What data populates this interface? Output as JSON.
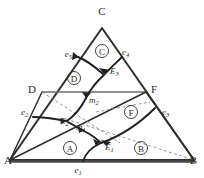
{
  "diagram": {
    "type": "ternary-phase-diagram",
    "background_color": "#ffffff",
    "line_color": "#2e2e2e",
    "dashed_color": "#8c8c8c",
    "curve_color": "#1f1f1f",
    "vertices": [
      {
        "id": "A",
        "label": "A",
        "x": 10,
        "y": 160,
        "label_x": 6,
        "label_y": 164
      },
      {
        "id": "B",
        "label": "B",
        "x": 194,
        "y": 160,
        "label_x": 192,
        "label_y": 164
      },
      {
        "id": "C",
        "label": "C",
        "x": 102,
        "y": 28,
        "label_x": 102,
        "label_y": 13
      },
      {
        "id": "D",
        "label": "D",
        "x": 42,
        "y": 92,
        "label_x": 34,
        "label_y": 91
      },
      {
        "id": "F",
        "label": "F",
        "x": 146,
        "y": 92,
        "label_x": 152,
        "label_y": 91
      }
    ],
    "invariant_points": [
      {
        "id": "E1",
        "base": "E",
        "subscript": "1",
        "label_x": 108,
        "label_y": 148
      },
      {
        "id": "E2",
        "base": "E",
        "subscript": "2",
        "label_x": 62,
        "label_y": 121
      },
      {
        "id": "E3",
        "base": "E",
        "subscript": "3",
        "label_x": 114,
        "label_y": 71
      },
      {
        "id": "m1",
        "base": "m",
        "subscript": "1",
        "label_x": 79,
        "label_y": 128
      },
      {
        "id": "m2",
        "base": "m",
        "subscript": "2",
        "label_x": 93,
        "label_y": 101
      }
    ],
    "edge_eutectics": [
      {
        "id": "e1",
        "base": "e",
        "subscript": "1",
        "label_x": 80,
        "label_y": 172
      },
      {
        "id": "e2",
        "base": "e",
        "subscript": "2",
        "label_x": 24,
        "label_y": 113
      },
      {
        "id": "e3",
        "base": "e",
        "subscript": "3",
        "label_x": 166,
        "label_y": 113
      },
      {
        "id": "e4",
        "base": "e",
        "subscript": "4",
        "label_x": 125,
        "label_y": 53
      },
      {
        "id": "e5",
        "base": "e",
        "subscript": "5",
        "label_x": 68,
        "label_y": 55
      }
    ],
    "primary_fields": [
      {
        "id": "A",
        "label": "A",
        "cx": 70,
        "cy": 148,
        "r": 6.5
      },
      {
        "id": "B",
        "label": "B",
        "cx": 141,
        "cy": 148,
        "r": 6.5
      },
      {
        "id": "C",
        "label": "C",
        "cx": 102,
        "cy": 51,
        "r": 6.5
      },
      {
        "id": "D",
        "label": "D",
        "cx": 74,
        "cy": 78,
        "r": 6.5
      },
      {
        "id": "F",
        "label": "F",
        "cx": 131,
        "cy": 112,
        "r": 6.5
      }
    ],
    "legend": {
      "outer_triangle": "A-B-C ternary composition triangle",
      "join_DF": "D-F compatibility join",
      "solid_curves": "liquidus boundary curves with arrows",
      "dashed_lines": "Alkemade / subsolidus tie lines"
    }
  }
}
